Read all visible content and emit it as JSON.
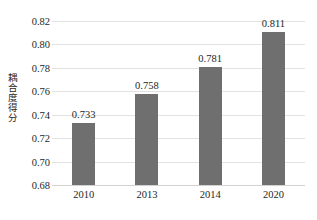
{
  "chart_data": {
    "type": "bar",
    "title": "",
    "subtitle": "",
    "xlabel": "",
    "ylabel": "耦合度得分",
    "categories": [
      "2010",
      "2013",
      "2014",
      "2020"
    ],
    "values": [
      0.733,
      0.758,
      0.781,
      0.811
    ],
    "value_labels": [
      "0.733",
      "0.758",
      "0.781",
      "0.811"
    ],
    "series": [
      {
        "name": "耦合度得分",
        "values": [
          0.733,
          0.758,
          0.781,
          0.811
        ]
      }
    ],
    "ylim": [
      0.68,
      0.82
    ],
    "ytick_values": [
      0.68,
      0.7,
      0.72,
      0.74,
      0.76,
      0.78,
      0.8,
      0.82
    ],
    "ytick_labels": [
      "0.68",
      "0.70",
      "0.72",
      "0.74",
      "0.76",
      "0.78",
      "0.80",
      "0.82"
    ],
    "grid": true,
    "grid_axis": "y",
    "legend": false,
    "legend_position": "none",
    "bar_color": "#6f6f6f",
    "gridline_color": "#e2e2e2",
    "text_color": "#231f1f",
    "background_color": "#ffffff"
  },
  "caption": {
    "text": ""
  }
}
